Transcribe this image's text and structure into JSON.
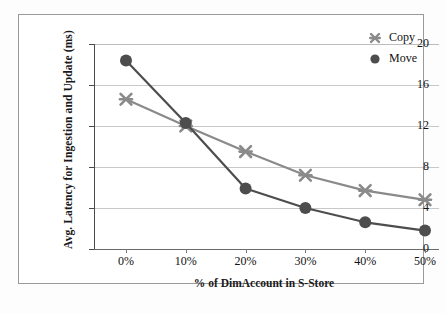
{
  "chart_data": {
    "type": "line",
    "title": "",
    "xlabel": "% of DimAccount in S-Store",
    "ylabel": "Avg. Latency for Ingestion and Update (ms)",
    "categories": [
      "0%",
      "10%",
      "20%",
      "30%",
      "40%",
      "50%"
    ],
    "x": [
      0,
      10,
      20,
      30,
      40,
      50
    ],
    "series": [
      {
        "name": "Copy",
        "marker": "x-cross",
        "color": "#8a8a8a",
        "values": [
          14.6,
          12.0,
          9.5,
          7.2,
          5.7,
          4.8
        ]
      },
      {
        "name": "Move",
        "marker": "filled-circle",
        "color": "#4d4d4d",
        "values": [
          18.4,
          12.3,
          5.9,
          4.0,
          2.6,
          1.8
        ]
      }
    ],
    "ylim": [
      0,
      20
    ],
    "yticks": [
      0,
      4,
      8,
      12,
      16,
      20
    ],
    "ytick_labels": [
      "0",
      "4",
      "8",
      "12",
      "16",
      "20"
    ],
    "xlim": [
      0,
      50
    ],
    "grid": "horizontal",
    "legend_position": "top-right",
    "legend_entries": [
      "Copy",
      "Move"
    ]
  },
  "figure": {
    "border_color": "#9a9a9a",
    "background": "#ffffff"
  }
}
